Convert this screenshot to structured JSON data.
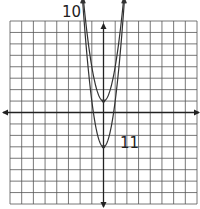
{
  "chart_data": {
    "type": "line",
    "title": "",
    "xlabel": "",
    "ylabel": "",
    "grid": true,
    "xlim": [
      -8,
      8
    ],
    "ylim": [
      -8,
      8
    ],
    "series": [
      {
        "name": "10",
        "label": "10",
        "equation": "y = 3x^2 + 1",
        "vertex": [
          0,
          1
        ],
        "a": 3,
        "k": 1
      },
      {
        "name": "11",
        "label": "11",
        "equation": "y = 4x^2 - 3",
        "vertex": [
          0,
          -3
        ],
        "a": 4,
        "k": -3
      }
    ],
    "annotations": [
      {
        "text": "10",
        "near": "upper-left curve end"
      },
      {
        "text": "11",
        "near": "lower vertex"
      }
    ]
  },
  "labels": {
    "graph10": "10",
    "graph11": "11"
  },
  "colors": {
    "grid": "#555555",
    "axis": "#222222",
    "curve": "#333333"
  }
}
